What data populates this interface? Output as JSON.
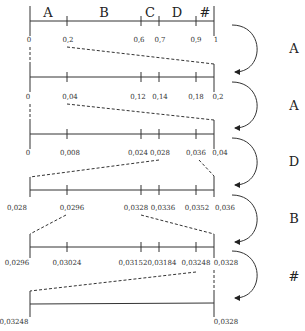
{
  "symbols": [
    {
      "label": "A",
      "from": 0,
      "to": 0.2
    },
    {
      "label": "B",
      "from": 0.2,
      "to": 0.6
    },
    {
      "label": "C",
      "from": 0.6,
      "to": 0.7
    },
    {
      "label": "D",
      "from": 0.7,
      "to": 0.9
    },
    {
      "label": "#",
      "from": 0.9,
      "to": 1
    }
  ],
  "rows": [
    {
      "ticks": [
        "0",
        "0,2",
        "0,6",
        "0,7",
        "0,9",
        "1"
      ]
    },
    {
      "ticks": [
        "0",
        "0,04",
        "0,12",
        "0,14",
        "0,18",
        "0,2"
      ]
    },
    {
      "ticks": [
        "0",
        "0,008",
        "0,024",
        "0,028",
        "0,036",
        "0,04"
      ]
    },
    {
      "ticks": [
        "0,028",
        "0,0296",
        "0,0328",
        "0,0336",
        "0,0352",
        "0,036"
      ]
    },
    {
      "ticks": [
        "0,0296",
        "0,03024",
        "0,03152",
        "0,03184",
        "0,03248",
        "0,0328"
      ]
    },
    {
      "ticks": [
        "0,03248",
        "0,0328"
      ]
    }
  ],
  "steps": [
    {
      "symbol": "A"
    },
    {
      "symbol": "A"
    },
    {
      "symbol": "D"
    },
    {
      "symbol": "B"
    },
    {
      "symbol": "#"
    }
  ]
}
